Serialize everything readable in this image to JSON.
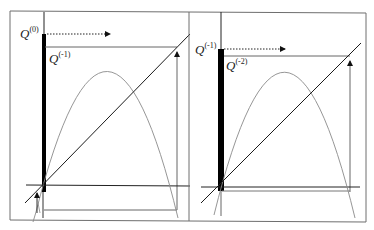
{
  "figure": {
    "colors": {
      "axis": "#111111",
      "curve": "#8a8a8a",
      "diagonal": "#1a1a1a",
      "guide": "#555555",
      "frame": "#6e6e6e",
      "thick_bar": "#000000"
    },
    "panels": [
      {
        "id": "left",
        "label_top": {
          "base": "Q",
          "sup": "(0)"
        },
        "label_inner": {
          "base": "Q",
          "sup": "(-1)"
        },
        "dotted_arrow": "rightward dotted arrow from upper label",
        "arrow_markers": [
          "up-arrow at diagonal intersection (top right)",
          "up-arrow near origin (bottom left)"
        ]
      },
      {
        "id": "right",
        "label_top": {
          "base": "Q",
          "sup": "(-1)"
        },
        "label_inner": {
          "base": "Q",
          "sup": "(-2)"
        },
        "dotted_arrow": "rightward dotted arrow from upper label",
        "arrow_markers": [
          "up-arrow at diagonal intersection (top right)"
        ]
      }
    ]
  }
}
